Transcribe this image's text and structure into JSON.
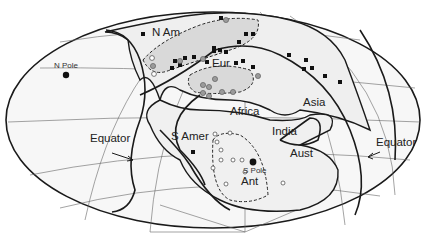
{
  "map": {
    "projection": "Mollweide (elliptical equal-area)",
    "colors": {
      "background": "#ffffff",
      "globe_fill": "#f4f4f4",
      "land_fill": "#efefef",
      "shaded_region": "#dcdcdc",
      "coastline": "#1a1a1a",
      "graticule": "#555555",
      "square_marker": "#111111",
      "circle_marker_fill": "#9a9a9a",
      "open_circle_marker": "#ffffff"
    },
    "labels": {
      "n_am": "N Am",
      "eur": "Eur",
      "africa": "Africa",
      "asia": "Asia",
      "s_amer": "S Amer",
      "india": "India",
      "aust": "Aust",
      "ant": "Ant",
      "n_pole": "N Pole",
      "s_pole": "S Pole",
      "equator_left": "Equator",
      "equator_right": "Equator"
    },
    "legend_markers": {
      "black_square": "filled square data points",
      "grey_circle": "grey filled circle data points",
      "open_circle": "open circle data points",
      "pole": "filled black pole marker"
    }
  }
}
